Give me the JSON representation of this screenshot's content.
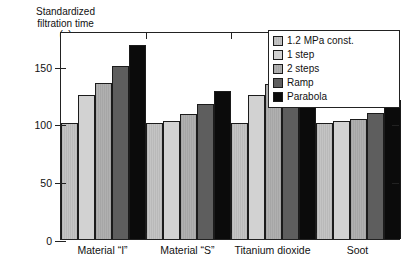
{
  "chart_data": {
    "type": "bar",
    "title": "",
    "ylabel": "Standardized filtration time (–)",
    "ylabel_lines": [
      "Standardized",
      "filtration time",
      "(–)"
    ],
    "xlabel": "",
    "ylim": [
      0,
      180
    ],
    "yticks": [
      0,
      50,
      100,
      150
    ],
    "ytick_labels": [
      "0",
      "50",
      "100",
      "150"
    ],
    "grid": false,
    "legend_position": "top-right",
    "categories": [
      "Material “I”",
      "Material “S”",
      "Titanium dioxide",
      "Soot"
    ],
    "series": [
      {
        "name": "1.2 MPa const.",
        "color": "#bfbfbf",
        "values": [
          100,
          100,
          100,
          100
        ]
      },
      {
        "name": "1 step",
        "color": "#d2d2d2",
        "values": [
          125,
          102,
          125,
          102
        ]
      },
      {
        "name": "2 steps",
        "color": "#ababab",
        "values": [
          135,
          108,
          134,
          104
        ]
      },
      {
        "name": "Ramp",
        "color": "#5e5e5e",
        "values": [
          150,
          117,
          150,
          109
        ]
      },
      {
        "name": "Parabola",
        "color": "#0b0b0b",
        "values": [
          168,
          128,
          169,
          120
        ]
      }
    ]
  },
  "legend": {
    "items": [
      {
        "label": "1.2 MPa const."
      },
      {
        "label": "1 step"
      },
      {
        "label": "2 steps"
      },
      {
        "label": "Ramp"
      },
      {
        "label": "Parabola"
      }
    ]
  }
}
